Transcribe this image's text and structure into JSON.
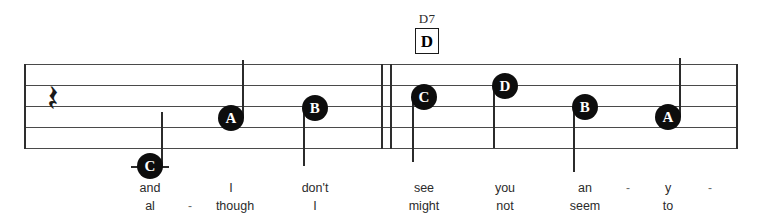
{
  "score": {
    "type": "music-notation",
    "system_label": "single-staff-system",
    "staff": {
      "left": 24,
      "right": 737,
      "top": 64,
      "bottom": 148,
      "line_spacing": 21,
      "line_count": 5,
      "line_color": "#4a4a4a"
    },
    "barlines": [
      {
        "name": "staff-start-barline",
        "x": 24,
        "kind": "single"
      },
      {
        "name": "double-barline-left",
        "x": 381,
        "kind": "single"
      },
      {
        "name": "double-barline-right",
        "x": 390,
        "kind": "single"
      },
      {
        "name": "staff-end-barline",
        "x": 736,
        "kind": "single"
      }
    ],
    "clef_area": {
      "rest": {
        "name": "quarter-rest",
        "glyph": "𝄽",
        "x": 56,
        "y": 106
      }
    },
    "chords": [
      {
        "name": "D7",
        "boxed_letter": "D",
        "x": 427,
        "name_y": 12,
        "box_y": 27
      }
    ],
    "notes": [
      {
        "letter": "C",
        "x": 150,
        "y": 166,
        "stem": "up",
        "stem_top": 112,
        "ledger": true,
        "ledger_width": 38
      },
      {
        "letter": "A",
        "x": 231,
        "y": 118,
        "stem": "up",
        "stem_top": 60,
        "ledger": false,
        "ledger_width": 0
      },
      {
        "letter": "B",
        "x": 315,
        "y": 108,
        "stem": "down",
        "stem_top": 108,
        "stem_bottom": 166,
        "ledger": false,
        "ledger_width": 0
      },
      {
        "letter": "C",
        "x": 424,
        "y": 97,
        "stem": "down",
        "stem_top": 97,
        "stem_bottom": 162,
        "ledger": false,
        "ledger_width": 0
      },
      {
        "letter": "D",
        "x": 505,
        "y": 86,
        "stem": "down",
        "stem_top": 86,
        "stem_bottom": 148,
        "ledger": false,
        "ledger_width": 0
      },
      {
        "letter": "B",
        "x": 585,
        "y": 107,
        "stem": "down",
        "stem_top": 107,
        "stem_bottom": 172,
        "ledger": false,
        "ledger_width": 0
      },
      {
        "letter": "A",
        "x": 668,
        "y": 117,
        "stem": "up",
        "stem_top": 58,
        "ledger": false,
        "ledger_width": 0
      }
    ],
    "lyrics": {
      "verse1_y": 182,
      "verse2_y": 200,
      "verse1": [
        {
          "text": "and",
          "x": 150
        },
        {
          "text": "I",
          "x": 231
        },
        {
          "text": "don't",
          "x": 315
        },
        {
          "text": "see",
          "x": 424
        },
        {
          "text": "you",
          "x": 505
        },
        {
          "text": "an",
          "x": 585
        },
        {
          "text": "-",
          "x": 628,
          "dash": true
        },
        {
          "text": "y",
          "x": 668
        },
        {
          "text": "-",
          "x": 710,
          "dash": true
        }
      ],
      "verse2": [
        {
          "text": "al",
          "x": 150
        },
        {
          "text": "-",
          "x": 190,
          "dash": true
        },
        {
          "text": "though",
          "x": 235
        },
        {
          "text": "I",
          "x": 315
        },
        {
          "text": "might",
          "x": 424
        },
        {
          "text": "not",
          "x": 505
        },
        {
          "text": "seem",
          "x": 585
        },
        {
          "text": "to",
          "x": 668
        }
      ]
    }
  }
}
